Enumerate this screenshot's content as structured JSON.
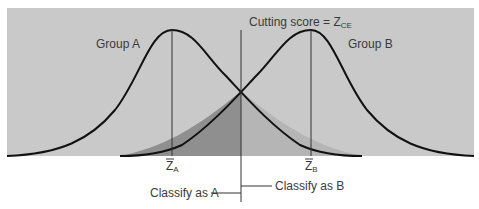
{
  "diagram": {
    "title": "Cutting score = Z",
    "title_subscript": "CE",
    "groups": [
      {
        "label": "Group A",
        "mean_label": "Z",
        "mean_subscript": "A"
      },
      {
        "label": "Group B",
        "mean_label": "Z",
        "mean_subscript": "B"
      }
    ],
    "classify_a": "Classify as A",
    "classify_b": "Classify as B",
    "colors": {
      "panel": "#c9c9c9",
      "overlap_dark": "#8f8f8f",
      "overlap_light": "#b5b5b5",
      "curve": "#111111",
      "text": "#3a3a3a"
    }
  }
}
